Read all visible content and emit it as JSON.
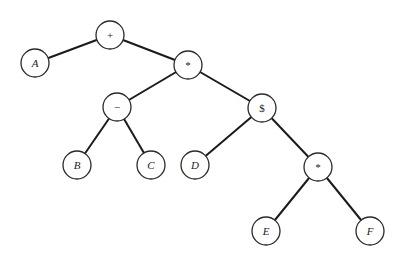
{
  "diagram": {
    "type": "expression-tree",
    "nodes": [
      {
        "id": "n0",
        "label": "+",
        "x": 110,
        "y": 35,
        "kind": "op"
      },
      {
        "id": "n1",
        "label": "A",
        "x": 35,
        "y": 63,
        "kind": "var"
      },
      {
        "id": "n2",
        "label": "*",
        "x": 188,
        "y": 65,
        "kind": "op"
      },
      {
        "id": "n3",
        "label": "−",
        "x": 117,
        "y": 107,
        "kind": "op"
      },
      {
        "id": "n4",
        "label": "$",
        "x": 262,
        "y": 108,
        "kind": "op"
      },
      {
        "id": "n5",
        "label": "B",
        "x": 77,
        "y": 165,
        "kind": "var"
      },
      {
        "id": "n6",
        "label": "C",
        "x": 151,
        "y": 165,
        "kind": "var"
      },
      {
        "id": "n7",
        "label": "D",
        "x": 195,
        "y": 165,
        "kind": "var"
      },
      {
        "id": "n8",
        "label": "*",
        "x": 318,
        "y": 167,
        "kind": "op"
      },
      {
        "id": "n9",
        "label": "E",
        "x": 266,
        "y": 231,
        "kind": "var"
      },
      {
        "id": "n10",
        "label": "F",
        "x": 370,
        "y": 231,
        "kind": "var"
      }
    ],
    "edges": [
      [
        "n0",
        "n1"
      ],
      [
        "n0",
        "n2"
      ],
      [
        "n2",
        "n3"
      ],
      [
        "n2",
        "n4"
      ],
      [
        "n3",
        "n5"
      ],
      [
        "n3",
        "n6"
      ],
      [
        "n4",
        "n7"
      ],
      [
        "n4",
        "n8"
      ],
      [
        "n8",
        "n9"
      ],
      [
        "n8",
        "n10"
      ]
    ],
    "node_radius": 14
  }
}
